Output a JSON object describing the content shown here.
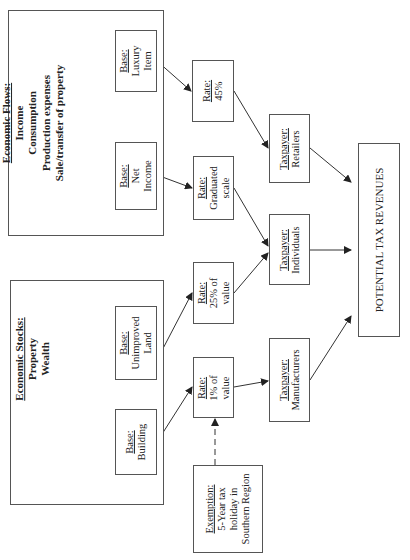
{
  "diagram": {
    "orientation": "rotated 90 degrees counter-clockwise",
    "groups": {
      "flows": {
        "heading": "Economic Flows:",
        "items": [
          "Income",
          "Consumption",
          "Production expenses",
          "Sale/transfer of property"
        ]
      },
      "stocks": {
        "heading": "Economic Stocks:",
        "items": [
          "Property",
          "Wealth"
        ]
      }
    },
    "bases": {
      "luxury": {
        "label": "Base:",
        "lines": [
          "Luxury",
          "Item"
        ]
      },
      "net_income": {
        "label": "Base:",
        "lines": [
          "Net",
          "Income"
        ]
      },
      "unimproved": {
        "label": "Base:",
        "lines": [
          "Unimproved",
          "Land"
        ]
      },
      "building": {
        "label": "Base:",
        "lines": [
          "Building"
        ]
      }
    },
    "rates": {
      "r45": {
        "label": "Rate:",
        "lines": [
          "45%"
        ]
      },
      "graduated": {
        "label": "Rate:",
        "lines": [
          "Graduated",
          "scale"
        ]
      },
      "r25": {
        "label": "Rate:",
        "lines": [
          "25% of",
          "value"
        ]
      },
      "r1": {
        "label": "Rate:",
        "lines": [
          "1% of",
          "value"
        ]
      }
    },
    "taxpayers": {
      "retailers": {
        "label": "Taxpayer:",
        "lines": [
          "Retailers"
        ]
      },
      "individuals": {
        "label": "Taxpayer:",
        "lines": [
          "Individuals"
        ]
      },
      "manufacturers": {
        "label": "Taxpayer:",
        "lines": [
          "Manufacturers"
        ]
      }
    },
    "exemption": {
      "label": "Exemption:",
      "lines": [
        "5-Year tax",
        "holiday in",
        "Southern Region"
      ]
    },
    "outcome": {
      "label": "POTENTIAL TAX REVENUES"
    },
    "edges": [
      {
        "from": "Base: Luxury Item",
        "to": "Rate: 45%",
        "style": "solid"
      },
      {
        "from": "Base: Net Income",
        "to": "Rate: Graduated scale",
        "style": "solid"
      },
      {
        "from": "Base: Unimproved Land",
        "to": "Rate: 25% of value",
        "style": "solid"
      },
      {
        "from": "Base: Building",
        "to": "Rate: 1% of value",
        "style": "solid"
      },
      {
        "from": "Rate: 45%",
        "to": "Taxpayer: Retailers",
        "style": "solid"
      },
      {
        "from": "Rate: Graduated scale",
        "to": "Taxpayer: Individuals",
        "style": "solid"
      },
      {
        "from": "Rate: 25% of value",
        "to": "Taxpayer: Individuals",
        "style": "solid"
      },
      {
        "from": "Rate: 1% of value",
        "to": "Taxpayer: Manufacturers",
        "style": "solid"
      },
      {
        "from": "Taxpayer: Retailers",
        "to": "POTENTIAL TAX REVENUES",
        "style": "solid"
      },
      {
        "from": "Taxpayer: Individuals",
        "to": "POTENTIAL TAX REVENUES",
        "style": "solid"
      },
      {
        "from": "Taxpayer: Manufacturers",
        "to": "POTENTIAL TAX REVENUES",
        "style": "solid"
      },
      {
        "from": "Exemption: 5-Year tax holiday in Southern Region",
        "to": "Rate: 1% of value",
        "style": "dashed"
      }
    ]
  }
}
